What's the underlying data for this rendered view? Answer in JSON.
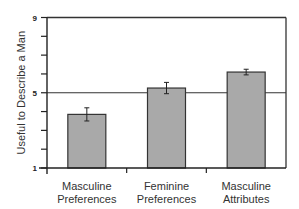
{
  "chart_data": {
    "type": "bar",
    "title": "",
    "xlabel": "",
    "ylabel": "Useful to Describe a Man",
    "ylim": [
      1,
      9
    ],
    "yticks": [
      1,
      2,
      3,
      4,
      5,
      6,
      7,
      8,
      9
    ],
    "ytick_labels": {
      "1": "1",
      "5": "5",
      "9": "9"
    },
    "reference_line": 5,
    "categories": [
      "Masculine\nPreferences",
      "Feminine\nPreferences",
      "Masculine\nAttributes"
    ],
    "values": [
      3.85,
      5.25,
      6.1
    ],
    "errors": [
      0.35,
      0.3,
      0.15
    ],
    "bar_color": "#a9a9a9",
    "grid": false,
    "legend": null
  }
}
